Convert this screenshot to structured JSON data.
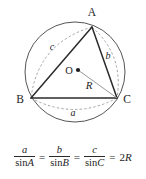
{
  "figure": {
    "vertices": [
      {
        "id": "A",
        "label": "A",
        "x": 92,
        "y": 27,
        "label_x": 92,
        "label_y": 16
      },
      {
        "id": "B",
        "label": "B",
        "x": 31,
        "y": 98,
        "label_x": 20,
        "label_y": 102
      },
      {
        "id": "C",
        "label": "C",
        "x": 117,
        "y": 98,
        "label_x": 126,
        "label_y": 102
      }
    ],
    "center": {
      "id": "O",
      "label": "O",
      "x": 78,
      "y": 70,
      "label_x": 69,
      "label_y": 73
    },
    "circle": {
      "cx": 75,
      "cy": 72,
      "r": 50
    },
    "radius": {
      "label": "R",
      "label_x": 89,
      "label_y": 88,
      "from": "O",
      "to": "C"
    },
    "arcs": [
      {
        "label": "a",
        "label_x": 73,
        "label_y": 116,
        "between": "B-C"
      },
      {
        "label": "b",
        "label_x": 108,
        "label_y": 58,
        "between": "A-C"
      },
      {
        "label": "c",
        "label_x": 52,
        "label_y": 49,
        "between": "A-B"
      }
    ],
    "colors": {
      "stroke": "#2b2b2b",
      "circle_stroke": "#555555",
      "dashed_stroke": "#9a9a9a",
      "radius_stroke": "#9a9a9a",
      "background": "#ffffff"
    }
  },
  "formula": {
    "caption": "a/sin A = b/sin B = c/sin C = 2R",
    "terms": [
      {
        "numerator": "a",
        "denominator_fn": "sin",
        "denominator_var": "A"
      },
      {
        "numerator": "b",
        "denominator_fn": "sin",
        "denominator_var": "B"
      },
      {
        "numerator": "c",
        "denominator_fn": "sin",
        "denominator_var": "C"
      }
    ],
    "equals": "=",
    "result_number": "2",
    "result_var": "R"
  }
}
